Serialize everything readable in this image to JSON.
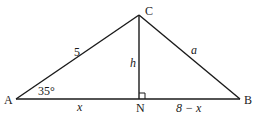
{
  "figure": {
    "vertices": {
      "A": "A",
      "B": "B",
      "C": "C",
      "N": "N"
    },
    "side_labels": {
      "AC": "5",
      "CB": "a",
      "CN": "h",
      "AN": "x",
      "NB": "8 − x"
    },
    "angle_labels": {
      "A": "35°"
    },
    "right_angle_at": "N"
  }
}
